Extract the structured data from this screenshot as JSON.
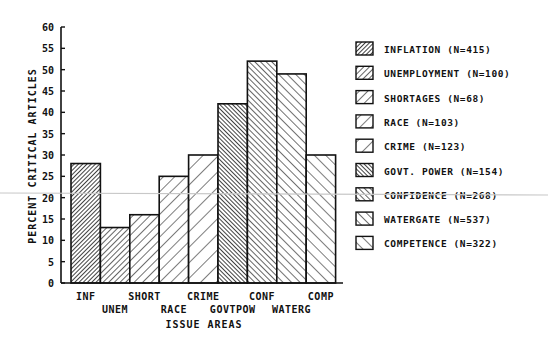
{
  "chart_data": {
    "type": "bar",
    "title": "",
    "xlabel": "ISSUE AREAS",
    "ylabel": "PERCENT CRITICAL ARTICLES",
    "ylim": [
      0,
      60
    ],
    "yticks": [
      0,
      5,
      10,
      15,
      20,
      25,
      30,
      35,
      40,
      45,
      50,
      55,
      60
    ],
    "grid": false,
    "legend_position": "right",
    "categories": [
      "INF",
      "UNEM",
      "SHORT",
      "RACE",
      "CRIME",
      "GOVTPOW",
      "CONF",
      "WATERG",
      "COMP"
    ],
    "values": [
      28,
      13,
      16,
      25,
      30,
      42,
      52,
      49,
      30
    ],
    "legend": [
      {
        "label": "INFLATION (N=415)",
        "pattern": "dense-right"
      },
      {
        "label": "UNEMPLOYMENT (N=100)",
        "pattern": "medium-right"
      },
      {
        "label": "SHORTAGES (N=68)",
        "pattern": "light-right"
      },
      {
        "label": "RACE (N=103)",
        "pattern": "sparse-right"
      },
      {
        "label": "CRIME (N=123)",
        "pattern": "very-sparse-right"
      },
      {
        "label": "GOVT. POWER (N=154)",
        "pattern": "dense-left"
      },
      {
        "label": "CONFIDENCE (N=268)",
        "pattern": "medium-left"
      },
      {
        "label": "WATERGATE (N=537)",
        "pattern": "light-left"
      },
      {
        "label": "COMPETENCE (N=322)",
        "pattern": "sparse-left"
      }
    ],
    "colors": {
      "ink": "#111111",
      "background": "#ffffff",
      "artifact_line": "#c8c8c8"
    }
  }
}
